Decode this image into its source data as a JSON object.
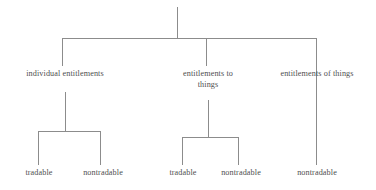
{
  "diagram": {
    "type": "tree",
    "title": "",
    "background_color": "#ffffff",
    "line_color": "#8c8c8c",
    "text_color": "#4f4f4f",
    "root": {
      "label": ""
    },
    "level2": [
      {
        "id": "individual-entitlements",
        "label": "individual entitlements"
      },
      {
        "id": "entitlements-to-things",
        "label": "entitlements to\nthings"
      },
      {
        "id": "entitlements-of-things",
        "label": "entitlements of things"
      }
    ],
    "level3": {
      "individual_entitlements": [
        {
          "id": "individual-tradable",
          "label": "tradable"
        },
        {
          "id": "individual-nontradable",
          "label": "nontradable"
        }
      ],
      "entitlements_to_things": [
        {
          "id": "to-things-tradable",
          "label": "tradable"
        },
        {
          "id": "to-things-nontradable",
          "label": "nontradable"
        }
      ],
      "entitlements_of_things": [
        {
          "id": "of-things-nontradable",
          "label": "nontradable"
        }
      ]
    }
  }
}
